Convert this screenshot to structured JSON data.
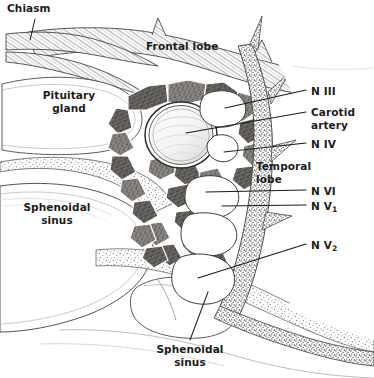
{
  "figure": {
    "width": 374,
    "height": 378,
    "background_color": "#ffffff",
    "ink_color": "#1b1b1b",
    "style": "pen-and-ink stipple medical illustration"
  },
  "labels": {
    "chiasm": "Chiasm",
    "frontal_lobe": "Frontal lobe",
    "pituitary_gland_line1": "Pituitary",
    "pituitary_gland_line2": "gland",
    "sphenoidal_sinus_left_line1": "Sphenoidal",
    "sphenoidal_sinus_left_line2": "sinus",
    "sphenoidal_sinus_bottom_line1": "Sphenoidal",
    "sphenoidal_sinus_bottom_line2": "sinus",
    "temporal_lobe_line1": "Temporal",
    "temporal_lobe_line2": "lobe",
    "n_iii": "N III",
    "carotid_artery_line1": "Carotid",
    "carotid_artery_line2": "artery",
    "n_iv": "N IV",
    "n_vi": "N VI",
    "n_v1_prefix": "N V",
    "n_v1_sub": "1",
    "n_v2_prefix": "N V",
    "n_v2_sub": "2"
  },
  "structures": [
    {
      "name": "optic-chiasm",
      "description": "stippled band upper left"
    },
    {
      "name": "frontal-lobe",
      "description": "shaded lobe across top"
    },
    {
      "name": "pituitary-gland",
      "description": "outlined sella region left of center"
    },
    {
      "name": "sphenoidal-sinus-left",
      "description": "large air cell lower left"
    },
    {
      "name": "sphenoidal-sinus-bottom",
      "description": "air cell bottom center"
    },
    {
      "name": "cavernous-sinus-trabeculae",
      "description": "dark venous network around carotid"
    },
    {
      "name": "internal-carotid-artery",
      "description": "concentric ring center"
    },
    {
      "name": "dural-lateral-wall",
      "description": "vertical stippled band right"
    },
    {
      "name": "temporal-lobe",
      "description": "shaded region right of dural wall"
    },
    {
      "name": "cranial-nerve-cross-sections",
      "description": "white ovals in lateral wall"
    }
  ]
}
